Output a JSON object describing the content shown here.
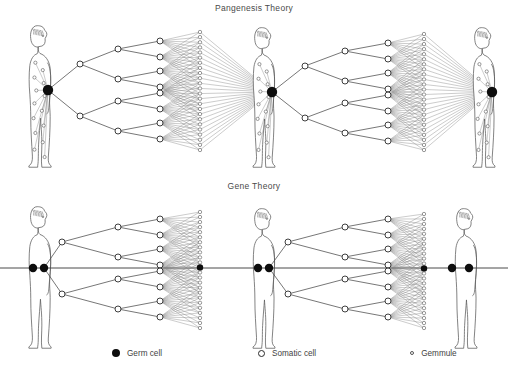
{
  "diagram": {
    "panels": [
      {
        "id": "pangenesis",
        "title": "Pangenesis Theory"
      },
      {
        "id": "gene",
        "title": "Gene Theory"
      }
    ],
    "legend": {
      "items": [
        {
          "key": "germ",
          "marker": "filled-circle-large",
          "label": "Germ cell"
        },
        {
          "key": "somatic",
          "marker": "open-circle-medium",
          "label": "Somatic cell"
        },
        {
          "key": "gemmule",
          "marker": "open-circle-small",
          "label": "Gemmule"
        }
      ]
    },
    "colors": {
      "germ_cell": "#0d0d0d",
      "somatic_cell_fill": "#ffffff",
      "somatic_cell_stroke": "#2a2a2a",
      "gemmule_stroke": "#555555",
      "line": "#4a4a4a",
      "body_outline": "#5a5a5a",
      "background": "#ffffff",
      "text": "#3f3f3f"
    },
    "pangenesis": {
      "description": "Germ cell branches into somatic cells; gemmules from all body cells converge back into the germ cell of the next generation.",
      "generations": 3,
      "branch_levels": 3,
      "somatic_terminal_count": 8,
      "gemmule_column_count": 24,
      "figures": [
        {
          "index": 0,
          "sex": "male",
          "germ_cell": {
            "x": 48,
            "y": 90
          },
          "body_gemmules": 14
        },
        {
          "index": 1,
          "sex": "female",
          "germ_cell": {
            "x": 272,
            "y": 92
          },
          "body_gemmules": 14
        },
        {
          "index": 2,
          "sex": "female",
          "germ_cell": {
            "x": 492,
            "y": 92
          },
          "body_gemmules": 14
        }
      ]
    },
    "gene": {
      "description": "A continuous germ line passes unchanged through generations; somatic cells branch off and terminate.",
      "germline_y": 268,
      "generations": 3,
      "branch_levels": 3,
      "somatic_terminal_count": 8,
      "gemmule_column_count": 24,
      "figures": [
        {
          "index": 0,
          "sex": "male",
          "germ_cells": [
            {
              "x": 33,
              "y": 268
            },
            {
              "x": 44,
              "y": 268
            }
          ]
        },
        {
          "index": 1,
          "sex": "female",
          "germ_cells": [
            {
              "x": 258,
              "y": 268
            },
            {
              "x": 269,
              "y": 268
            }
          ]
        },
        {
          "index": 2,
          "sex": "male",
          "germ_cells": [
            {
              "x": 452,
              "y": 268
            },
            {
              "x": 469,
              "y": 268
            }
          ]
        }
      ]
    }
  }
}
